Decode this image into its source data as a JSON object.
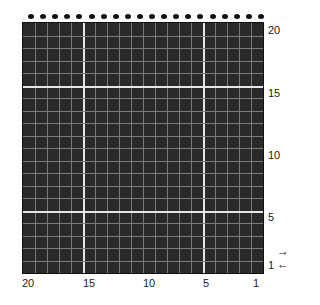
{
  "grid": {
    "columns": 20,
    "rows": 20,
    "background": "#2a2a2a",
    "major_line_color": "#e6e6e6",
    "minor_line_color": "#7a7a7a",
    "major_columns_from_left": [
      5,
      15
    ],
    "major_rows_from_top": [
      5,
      15
    ],
    "bead_dots_count": 20
  },
  "row_labels": {
    "r20": "20",
    "r15": "15",
    "r10": "10",
    "r5": "5",
    "r1": "1"
  },
  "column_labels": {
    "c20": "20",
    "c15": "15",
    "c10": "10",
    "c5": "5",
    "c1": "1"
  },
  "arrows": {
    "right": "→",
    "left": "←"
  }
}
